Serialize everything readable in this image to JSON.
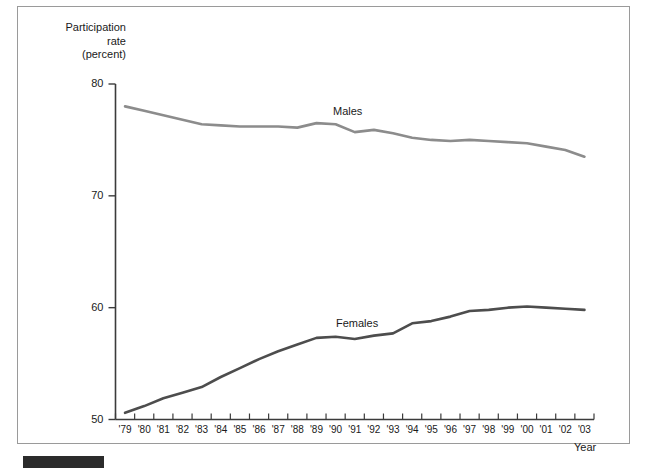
{
  "figure": {
    "y_axis_title": "Participation\nrate\n(percent)",
    "x_axis_title": "Year",
    "source_bar": ""
  },
  "chart_data": {
    "type": "line",
    "title": "",
    "subtitle": "",
    "xlabel": "Year",
    "ylabel": "Participation rate (percent)",
    "xlim": [
      1979,
      2003
    ],
    "ylim": [
      50,
      80
    ],
    "yticks": [
      50,
      60,
      70,
      80
    ],
    "ytick_labels": [
      "50",
      "60",
      "70",
      "80"
    ],
    "grid": false,
    "legend": "inline-labels",
    "x": [
      1979,
      1980,
      1981,
      1982,
      1983,
      1984,
      1985,
      1986,
      1987,
      1988,
      1989,
      1990,
      1991,
      1992,
      1993,
      1994,
      1995,
      1996,
      1997,
      1998,
      1999,
      2000,
      2001,
      2002,
      2003
    ],
    "categories": [
      "'79",
      "'80",
      "'81",
      "'82",
      "'83",
      "'84",
      "'85",
      "'86",
      "'87",
      "'88",
      "'89",
      "'90",
      "'91",
      "'92",
      "'93",
      "'94",
      "'95",
      "'96",
      "'97",
      "'98",
      "'99",
      "'00",
      "'01",
      "'02",
      "'03"
    ],
    "series": [
      {
        "name": "Males",
        "color": "#8c8c8c",
        "values": [
          78.0,
          77.6,
          77.2,
          76.8,
          76.4,
          76.3,
          76.2,
          76.2,
          76.2,
          76.1,
          76.5,
          76.4,
          75.7,
          75.9,
          75.6,
          75.2,
          75.0,
          74.9,
          75.0,
          74.9,
          74.8,
          74.7,
          74.4,
          74.1,
          73.5
        ],
        "end_label": "Males"
      },
      {
        "name": "Females",
        "color": "#4d4d4d",
        "values": [
          50.6,
          51.2,
          51.9,
          52.4,
          52.9,
          53.8,
          54.6,
          55.4,
          56.1,
          56.7,
          57.3,
          57.4,
          57.2,
          57.5,
          57.7,
          58.6,
          58.8,
          59.2,
          59.7,
          59.8,
          60.0,
          60.1,
          60.0,
          59.9,
          59.8
        ],
        "end_label": "Females"
      }
    ]
  }
}
